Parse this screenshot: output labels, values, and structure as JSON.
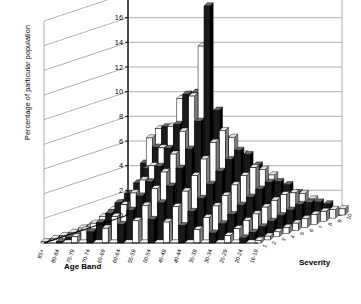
{
  "chart_data": {
    "type": "bar",
    "subtype": "3d-bar",
    "title": "",
    "xlabel": "Age Band",
    "zlabel": "Severity",
    "ylabel": "Percentage of particular population",
    "ylim": [
      0,
      18
    ],
    "ytick_step": 2,
    "yticks": [
      "0",
      "2",
      "4",
      "6",
      "8",
      "10",
      "12",
      "14",
      "16",
      "18"
    ],
    "grid": true,
    "legend": "none",
    "categories": [
      "85+",
      "80-84",
      "75-79",
      "70-74",
      "65-69",
      "60-64",
      "55-59",
      "50-54",
      "45-49",
      "40-44",
      "35-39",
      "30-34",
      "25-29",
      "20-24",
      "16-19"
    ],
    "series_axis_labels": [
      "10",
      "9",
      "8",
      "7",
      "6",
      "5",
      "4",
      "3",
      "2",
      "1"
    ],
    "series": [
      {
        "name": "10",
        "values": [
          1.2,
          4.2,
          7.0,
          6.9,
          6.6,
          6.0,
          4.8,
          4.0,
          3.4,
          2.8,
          2.3,
          1.8,
          1.3,
          0.9,
          0.5
        ]
      },
      {
        "name": "9",
        "values": [
          0.3,
          0.6,
          6.5,
          7.4,
          9.7,
          10.2,
          8.2,
          6.4,
          5.2,
          4.3,
          3.5,
          2.7,
          2.0,
          1.3,
          0.7
        ]
      },
      {
        "name": "8",
        "values": [
          0.2,
          0.5,
          2.9,
          6.0,
          7.7,
          10.3,
          14.2,
          9.0,
          6.8,
          5.4,
          4.2,
          3.2,
          2.3,
          1.5,
          0.8
        ]
      },
      {
        "name": "7",
        "values": [
          0.2,
          0.4,
          2.3,
          4.5,
          6.2,
          8.1,
          10.4,
          17.7,
          7.6,
          6.0,
          4.6,
          3.4,
          2.4,
          1.6,
          0.8
        ]
      },
      {
        "name": "6",
        "values": [
          0.2,
          0.4,
          2.0,
          3.6,
          5.0,
          6.4,
          7.8,
          8.6,
          6.9,
          5.5,
          4.2,
          3.1,
          2.2,
          1.4,
          0.7
        ]
      },
      {
        "name": "5",
        "values": [
          0.2,
          0.3,
          1.7,
          3.0,
          4.1,
          5.2,
          6.2,
          6.6,
          5.8,
          4.8,
          3.7,
          2.7,
          1.9,
          1.2,
          0.6
        ]
      },
      {
        "name": "4",
        "values": [
          0.1,
          0.3,
          1.4,
          2.5,
          3.3,
          4.2,
          5.0,
          5.3,
          4.7,
          4.0,
          3.1,
          2.3,
          1.6,
          1.0,
          0.5
        ]
      },
      {
        "name": "3",
        "values": [
          0.1,
          0.2,
          1.1,
          1.9,
          2.6,
          3.3,
          3.9,
          4.1,
          3.7,
          3.1,
          2.5,
          1.8,
          1.3,
          0.8,
          0.4
        ]
      },
      {
        "name": "2",
        "values": [
          0.1,
          0.2,
          0.8,
          1.4,
          1.9,
          2.4,
          2.8,
          3.0,
          2.7,
          2.3,
          1.8,
          1.3,
          0.9,
          0.6,
          0.3
        ]
      },
      {
        "name": "1",
        "values": [
          0.1,
          0.1,
          0.5,
          0.9,
          1.2,
          1.5,
          1.8,
          1.9,
          1.7,
          1.4,
          1.1,
          0.8,
          0.6,
          0.4,
          0.2
        ]
      }
    ],
    "colors": {
      "bar_light": "#ffffff",
      "bar_dark": "#1a1a1a",
      "bar_mid": "#808080",
      "outline": "#000000",
      "grid": "#8c8c8c",
      "background": "#ffffff"
    }
  },
  "axes": {
    "x_title": "Age Band",
    "z_title": "Severity",
    "y_title": "Percentage of particular population"
  }
}
